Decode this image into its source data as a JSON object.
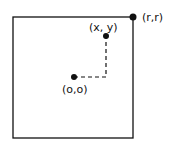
{
  "diagram": {
    "labels": {
      "corner": "(r,r)",
      "point": "(x, y)",
      "origin": "(o,o)"
    },
    "colors": {
      "stroke": "#111111",
      "background": "#ffffff"
    }
  }
}
